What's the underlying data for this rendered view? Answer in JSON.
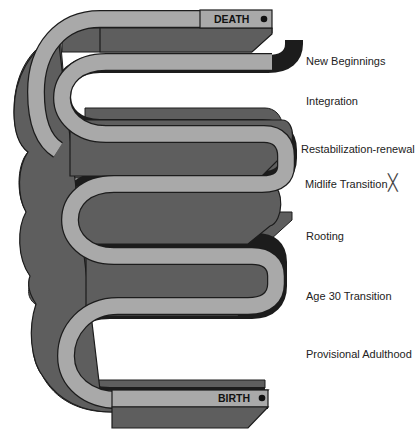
{
  "diagram": {
    "title": "",
    "colors": {
      "band_light": "#a9a9a9",
      "band_dark": "#5e5e5e",
      "outline": "#1c1c1c",
      "background": "#ffffff"
    },
    "end_labels": {
      "top": "DEATH",
      "bottom": "BIRTH"
    },
    "stages": [
      {
        "label": "New Beginnings",
        "marker": ""
      },
      {
        "label": "Integration",
        "marker": ""
      },
      {
        "label": "Restabilization-renewal",
        "marker": ""
      },
      {
        "label": "Midlife Transition",
        "marker": "╳"
      },
      {
        "label": "Rooting",
        "marker": ""
      },
      {
        "label": "Age 30 Transition",
        "marker": ""
      },
      {
        "label": "Provisional Adulthood",
        "marker": ""
      }
    ]
  }
}
